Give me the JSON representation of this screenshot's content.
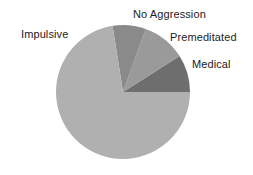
{
  "chart_data": {
    "type": "pie",
    "title": "",
    "start_angle_deg": 0,
    "direction": "counterclockwise",
    "slices": [
      {
        "label": "Medical",
        "value": 9,
        "color": "#6e6e6e"
      },
      {
        "label": "Premeditated",
        "value": 10.5,
        "color": "#9a9a9a"
      },
      {
        "label": "No Aggression",
        "value": 8,
        "color": "#8a8a8a"
      },
      {
        "label": "Impulsive",
        "value": 72.5,
        "color": "#b0b0b0"
      }
    ],
    "legend": "none (labels placed outside slices)"
  },
  "labels": {
    "impulsive": "Impulsive",
    "no_aggression": "No Aggression",
    "premeditated": "Premeditated",
    "medical": "Medical"
  }
}
